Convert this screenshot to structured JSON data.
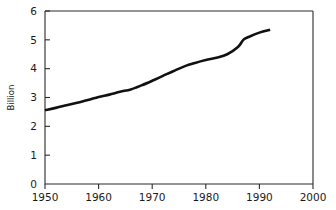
{
  "chart_data": {
    "type": "line",
    "title": "",
    "subtitle": "",
    "xlabel": "",
    "ylabel": "Billion",
    "xlim": [
      1950,
      2000
    ],
    "ylim": [
      0,
      6
    ],
    "grid": false,
    "legend": null,
    "x_ticks": [
      1950,
      1960,
      1970,
      1980,
      1990,
      2000
    ],
    "x_tick_labels": [
      "1950",
      "1960",
      "1970",
      "1980",
      "1990",
      "2000"
    ],
    "y_ticks": [
      0,
      1,
      2,
      3,
      4,
      5,
      6
    ],
    "y_tick_labels": [
      "0",
      "1",
      "2",
      "3",
      "4",
      "5",
      "6"
    ],
    "line_color": "#111111",
    "series": [
      {
        "name": "World population",
        "x": [
          1950,
          1952,
          1954,
          1956,
          1958,
          1960,
          1962,
          1964,
          1966,
          1968,
          1970,
          1972,
          1974,
          1976,
          1978,
          1980,
          1982,
          1984,
          1986,
          1987,
          1988,
          1990,
          1992
        ],
        "values": [
          2.56,
          2.64,
          2.73,
          2.82,
          2.91,
          3.02,
          3.1,
          3.2,
          3.28,
          3.42,
          3.58,
          3.75,
          3.92,
          4.08,
          4.2,
          4.3,
          4.38,
          4.5,
          4.75,
          5.0,
          5.1,
          5.25,
          5.35
        ]
      }
    ]
  },
  "labels": {
    "y_axis_title": "Billion"
  }
}
